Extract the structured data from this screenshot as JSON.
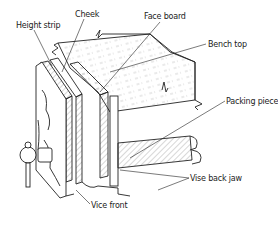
{
  "diagram": {
    "type": "technical-illustration",
    "labels": [
      {
        "id": "height-strip",
        "text": "Height strip"
      },
      {
        "id": "cheek",
        "text": "Cheek"
      },
      {
        "id": "face-board",
        "text": "Face board"
      },
      {
        "id": "bench-top",
        "text": "Bench top"
      },
      {
        "id": "packing-piece",
        "text": "Packing piece"
      },
      {
        "id": "vise-back-jaw",
        "text": "Vise back jaw"
      },
      {
        "id": "vice-front",
        "text": "Vice front"
      }
    ],
    "colors": {
      "line": "#222222",
      "hatch": "#777777",
      "background": "#ffffff"
    }
  }
}
